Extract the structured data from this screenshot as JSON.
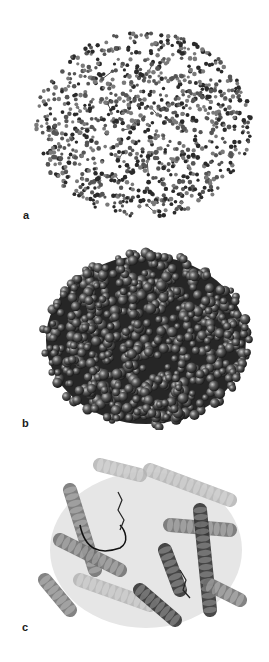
{
  "figure": {
    "background": "#ffffff",
    "panels": [
      {
        "id": "a",
        "label": "a",
        "representation": "ball-and-stick",
        "top": 0,
        "height": 230,
        "label_pos": {
          "x": 23,
          "y": 210
        },
        "bbox": {
          "cx": 143,
          "cy": 125,
          "rx": 108,
          "ry": 93
        },
        "colors": {
          "dark": "#2a2a2a",
          "mid": "#555555",
          "light": "#7a7a7a"
        }
      },
      {
        "id": "b",
        "label": "b",
        "representation": "space-filling",
        "top": 230,
        "height": 200,
        "label_pos": {
          "x": 22,
          "y": 188
        },
        "bbox": {
          "cx": 146,
          "cy": 110,
          "rx": 104,
          "ry": 88
        },
        "colors": {
          "dark": "#1c1c1c",
          "mid": "#5a5a5a",
          "light": "#9a9a9a"
        }
      },
      {
        "id": "c",
        "label": "c",
        "representation": "ribbon-cartoon",
        "top": 430,
        "height": 232,
        "label_pos": {
          "x": 22,
          "y": 192
        },
        "bbox": {
          "cx": 146,
          "cy": 120,
          "rx": 104,
          "ry": 88
        },
        "colors": {
          "dark": "#2b2b2b",
          "mid": "#6e6e6e",
          "light": "#b4b4b4"
        }
      }
    ]
  }
}
